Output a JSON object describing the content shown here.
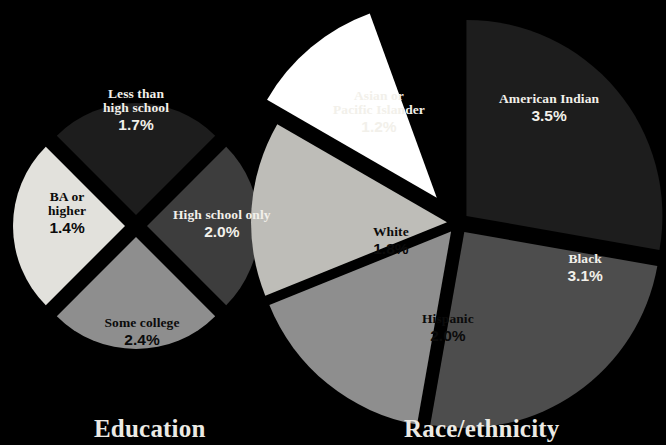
{
  "background_color": "#000000",
  "panels": [
    {
      "id": "education",
      "caption": "Education",
      "caption_pos": {
        "left": 94
      },
      "center": {
        "x": 136,
        "y": 226
      },
      "radius": 112,
      "explode": 11
    },
    {
      "id": "race",
      "caption": "Race/ethnicity",
      "caption_pos": {
        "left": 404
      },
      "center": {
        "x": 458,
        "y": 223
      },
      "radius": 196,
      "explode": 11
    }
  ],
  "chart_data": [
    {
      "type": "pie",
      "title": "Education",
      "categories": [
        "Less than high school",
        "High school only",
        "Some college",
        "BA or higher"
      ],
      "values": [
        1.7,
        2.0,
        2.4,
        1.4
      ],
      "value_labels": [
        "1.7%",
        "2.0%",
        "2.4%",
        "1.4%"
      ],
      "unit": "%",
      "slice_colors": [
        "#1d1d1d",
        "#3d3d3d",
        "#8e8e8e",
        "#e2e1dc"
      ],
      "slices": [
        {
          "label": "Less than high school",
          "label_lines": [
            "Less than",
            "high school"
          ],
          "value": 1.7,
          "value_label": "1.7%",
          "color": "#1d1d1d",
          "text_color": "#f2f0ea",
          "start_angle": -45,
          "end_angle": 45,
          "label_pos": {
            "x": 136,
            "y": 110
          }
        },
        {
          "label": "High school only",
          "label_lines": [
            "High school only"
          ],
          "value": 2.0,
          "value_label": "2.0%",
          "color": "#3d3d3d",
          "text_color": "#f2f0ea",
          "start_angle": 45,
          "end_angle": 135,
          "label_pos": {
            "x": 222,
            "y": 224
          }
        },
        {
          "label": "Some college",
          "label_lines": [
            "Some college"
          ],
          "value": 2.4,
          "value_label": "2.4%",
          "color": "#8e8e8e",
          "text_color": "#0b0b0b",
          "start_angle": 135,
          "end_angle": 225,
          "label_pos": {
            "x": 142,
            "y": 332
          }
        },
        {
          "label": "BA or higher",
          "label_lines": [
            "BA or",
            "higher"
          ],
          "value": 1.4,
          "value_label": "1.4%",
          "color": "#e2e1dc",
          "text_color": "#0b0b0b",
          "start_angle": 225,
          "end_angle": 315,
          "label_pos": {
            "x": 67,
            "y": 213
          }
        }
      ]
    },
    {
      "type": "pie",
      "title": "Race/ethnicity",
      "categories": [
        "American Indian",
        "Black",
        "Hispanic",
        "White",
        "Asian or Pacific Islander"
      ],
      "values": [
        3.5,
        3.1,
        2.0,
        1.8,
        1.2
      ],
      "value_labels": [
        "3.5%",
        "3.1%",
        "2.0%",
        "1.8%",
        "1.2%"
      ],
      "unit": "%",
      "slice_colors": [
        "#1d1d1d",
        "#4d4d4d",
        "#8e8e8e",
        "#bebdb8",
        "#ffffff"
      ],
      "slices": [
        {
          "label": "American Indian",
          "label_lines": [
            "American Indian"
          ],
          "value": 3.5,
          "value_label": "3.5%",
          "color": "#1d1d1d",
          "text_color": "#f2f0ea",
          "start_angle": 0,
          "end_angle": 100,
          "label_pos": {
            "x": 549,
            "y": 108
          },
          "label_inside": true
        },
        {
          "label": "Black",
          "label_lines": [
            "Black"
          ],
          "value": 3.1,
          "value_label": "3.1%",
          "color": "#4d4d4d",
          "text_color": "#f2f0ea",
          "start_angle": 100,
          "end_angle": 190,
          "label_pos": {
            "x": 585,
            "y": 268
          },
          "label_inside": true
        },
        {
          "label": "Hispanic",
          "label_lines": [
            "Hispanic"
          ],
          "value": 2.0,
          "value_label": "2.0%",
          "color": "#8e8e8e",
          "text_color": "#0b0b0b",
          "start_angle": 190,
          "end_angle": 248,
          "label_pos": {
            "x": 448,
            "y": 328
          },
          "label_inside": true
        },
        {
          "label": "White",
          "label_lines": [
            "White"
          ],
          "value": 1.8,
          "value_label": "1.8%",
          "color": "#bebdb8",
          "text_color": "#0b0b0b",
          "start_angle": 248,
          "end_angle": 300,
          "label_pos": {
            "x": 391,
            "y": 241
          },
          "label_inside": true
        },
        {
          "label": "Asian or Pacific Islander",
          "label_lines": [
            "Asian or",
            "Pacific Islander"
          ],
          "value": 1.2,
          "value_label": "1.2%",
          "color": "#ffffff",
          "text_color": "#f2f0ea",
          "start_angle": 300,
          "end_angle": 340,
          "label_pos": {
            "x": 379,
            "y": 112
          },
          "label_inside": false,
          "explode_extra": 22
        }
      ]
    }
  ]
}
